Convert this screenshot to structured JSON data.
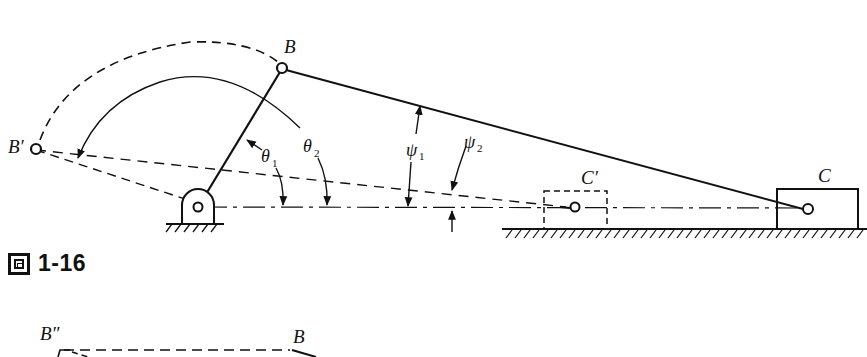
{
  "figure": {
    "caption_icon": "figure-glyph-icon",
    "caption_label": "1-16",
    "labels": {
      "B": "B",
      "B_prime": "B′",
      "C": "C",
      "C_prime": "C′",
      "theta1": "θ",
      "theta1_sub": "1",
      "theta2": "θ",
      "theta2_sub": "2",
      "psi1": "ψ",
      "psi1_sub": "1",
      "psi2": "ψ",
      "psi2_sub": "2",
      "B_double_prime": "B″",
      "B_lower": "B"
    }
  }
}
